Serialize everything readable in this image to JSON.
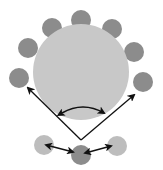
{
  "colors": {
    "background": "#ffffff",
    "central_circle": "#c8c8c8",
    "outer_circle": "#8c8c8c",
    "light_circle": "#bdbdbd",
    "arrow": "#111111"
  },
  "central_circle": {
    "cx": 81,
    "cy": 72,
    "r": 48
  },
  "outer_circles": [
    {
      "cx": 19,
      "cy": 78,
      "r": 10
    },
    {
      "cx": 28,
      "cy": 48,
      "r": 10
    },
    {
      "cx": 52,
      "cy": 28,
      "r": 10
    },
    {
      "cx": 81,
      "cy": 20,
      "r": 10
    },
    {
      "cx": 112,
      "cy": 29,
      "r": 10
    },
    {
      "cx": 134,
      "cy": 52,
      "r": 10
    },
    {
      "cx": 143,
      "cy": 82,
      "r": 10
    }
  ],
  "bottom_circles": [
    {
      "cx": 44,
      "cy": 145,
      "r": 10,
      "shade": "light"
    },
    {
      "cx": 81,
      "cy": 155,
      "r": 10,
      "shade": "dark"
    },
    {
      "cx": 117,
      "cy": 146,
      "r": 10,
      "shade": "light"
    }
  ]
}
